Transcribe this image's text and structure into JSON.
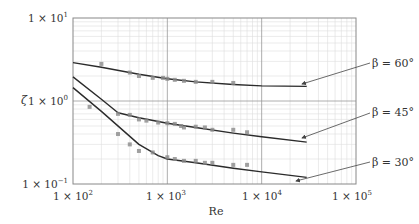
{
  "chart_data": {
    "type": "line",
    "title": "",
    "xlabel": "Re",
    "ylabel": "ζ",
    "xscale": "log",
    "yscale": "log",
    "xlim": [
      100,
      100000
    ],
    "ylim": [
      0.1,
      10
    ],
    "x_ticks": [
      "1 × 10^2",
      "1 × 10^3",
      "1 × 10^4",
      "1 × 10^5"
    ],
    "y_ticks": [
      "1 × 10^-1",
      "1 × 10^0",
      "1 × 10^1"
    ],
    "grid": true,
    "series": [
      {
        "name": "β = 60°",
        "fit_line": {
          "x": [
            100,
            200,
            500,
            1000,
            2000,
            5000,
            10000,
            30000
          ],
          "y": [
            2.9,
            2.55,
            2.1,
            1.85,
            1.7,
            1.58,
            1.52,
            1.5
          ]
        },
        "points": {
          "x": [
            200,
            400,
            500,
            700,
            900,
            1000,
            1200,
            1500,
            2000,
            3000,
            5000
          ],
          "y": [
            2.8,
            2.2,
            2.0,
            1.9,
            1.9,
            1.85,
            1.8,
            1.75,
            1.7,
            1.7,
            1.65
          ]
        }
      },
      {
        "name": "β = 45°",
        "fit_line": {
          "x": [
            100,
            200,
            300,
            500,
            1000,
            2000,
            5000,
            10000,
            30000
          ],
          "y": [
            1.95,
            1.05,
            0.72,
            0.63,
            0.54,
            0.48,
            0.41,
            0.37,
            0.32
          ]
        },
        "points": {
          "x": [
            150,
            300,
            400,
            500,
            600,
            800,
            1000,
            1200,
            1400,
            1500,
            2000,
            2500,
            3000,
            5000,
            7000
          ],
          "y": [
            0.85,
            0.7,
            0.68,
            0.6,
            0.58,
            0.55,
            0.54,
            0.53,
            0.5,
            0.48,
            0.49,
            0.48,
            0.45,
            0.45,
            0.42
          ]
        }
      },
      {
        "name": "β = 30°",
        "fit_line": {
          "x": [
            100,
            200,
            500,
            800,
            1000,
            2000,
            5000,
            10000,
            30000
          ],
          "y": [
            1.45,
            0.75,
            0.3,
            0.22,
            0.2,
            0.18,
            0.155,
            0.14,
            0.12
          ]
        },
        "points": {
          "x": [
            300,
            400,
            500,
            700,
            1000,
            1200,
            1500,
            2000,
            2500,
            3000,
            5000,
            7000
          ],
          "y": [
            0.4,
            0.3,
            0.25,
            0.24,
            0.21,
            0.2,
            0.19,
            0.19,
            0.18,
            0.18,
            0.17,
            0.17
          ]
        }
      }
    ],
    "annotations": [
      "β = 60°",
      "β = 45°",
      "β = 30°"
    ]
  },
  "labels": {
    "ylabel": "ζ",
    "xlabel": "Re",
    "beta60": "β = 60°",
    "beta45": "β = 45°",
    "beta30": "β = 30°"
  },
  "colors": {
    "line": "#2b2b2b",
    "points": "#8a8a8a",
    "grid_major": "#999999",
    "grid_minor": "#dddddd"
  }
}
